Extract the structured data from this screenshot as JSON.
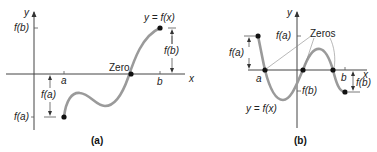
{
  "panel_a": {
    "caption": "(a)",
    "y_axis_label": "y",
    "x_axis_label": "x",
    "tick_a": "a",
    "tick_b": "b",
    "label_fb_axis": "f(b)",
    "label_fa_axis": "f(a)",
    "label_curve": "y = f(x)",
    "label_zero": "Zero",
    "label_fb_dim": "f(b)",
    "label_fa_dim": "f(a)"
  },
  "panel_b": {
    "caption": "(b)",
    "y_axis_label": "y",
    "x_axis_label": "x",
    "tick_a": "a",
    "tick_b": "b",
    "label_fa_axis": "f(a)",
    "label_fb_axis": "f(b)",
    "label_curve": "y = f(x)",
    "label_zeros": "Zeros",
    "label_fa_dim": "f(a)",
    "label_fb_dim": "f(b)"
  }
}
